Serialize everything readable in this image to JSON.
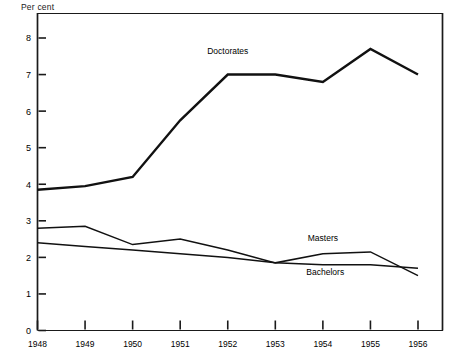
{
  "chart_data": {
    "type": "line",
    "title": "",
    "subtitle": "",
    "unit_label": "Per cent",
    "xlabel": "",
    "ylabel": "Per cent",
    "categories": [
      "1948",
      "1949",
      "1950",
      "1951",
      "1952",
      "1953",
      "1954",
      "1955",
      "1956"
    ],
    "x": [
      1948,
      1949,
      1950,
      1951,
      1952,
      1953,
      1954,
      1955,
      1956
    ],
    "xlim": [
      1948,
      1956
    ],
    "ylim": [
      0,
      8
    ],
    "ytick_labels": [
      "0",
      "1",
      "2",
      "3",
      "4",
      "5",
      "6",
      "7",
      "8"
    ],
    "ytick_values": [
      0,
      1,
      2,
      3,
      4,
      5,
      6,
      7,
      8
    ],
    "grid": false,
    "legend_position": "inline-annotations",
    "series": [
      {
        "name": "Doctorates",
        "label": "Doctorates",
        "values": [
          3.85,
          3.95,
          4.2,
          5.75,
          7.0,
          7.0,
          6.8,
          7.7,
          7.0
        ],
        "stroke_width": 2.4,
        "label_x": 1952.0,
        "label_y": 7.55
      },
      {
        "name": "Masters",
        "label": "Masters",
        "values": [
          2.8,
          2.85,
          2.35,
          2.5,
          2.2,
          1.85,
          2.1,
          2.15,
          1.5
        ],
        "stroke_width": 1.5,
        "label_x": 1954.0,
        "label_y": 2.45
      },
      {
        "name": "Bachelors",
        "label": "Bachelors",
        "values": [
          2.4,
          2.3,
          2.2,
          2.1,
          2.0,
          1.85,
          1.8,
          1.8,
          1.7
        ],
        "stroke_width": 1.5,
        "label_x": 1954.05,
        "label_y": 1.52
      }
    ],
    "colors": {
      "line": "#111111",
      "axis": "#1a1a1a",
      "background": "#ffffff",
      "text": "#1a1a1a"
    }
  }
}
